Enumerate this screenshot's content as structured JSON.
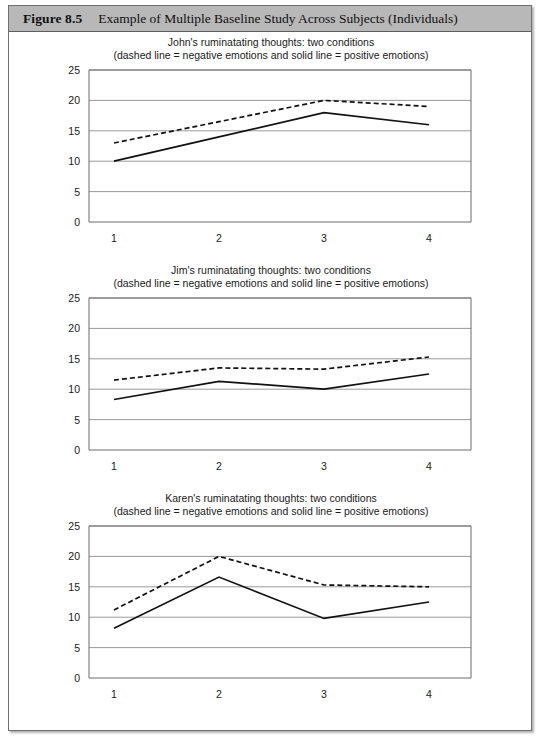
{
  "figure": {
    "number": "Figure 8.5",
    "caption": "Example of Multiple Baseline Study Across Subjects (Individuals)"
  },
  "axis": {
    "y_ticks": [
      "0",
      "5",
      "10",
      "15",
      "20",
      "25"
    ],
    "x_ticks": [
      "1",
      "2",
      "3",
      "4"
    ]
  },
  "charts": [
    {
      "title_line1": "John's ruminatating thoughts: two conditions",
      "title_line2": "(dashed line = negative emotions and solid line = positive emotions)"
    },
    {
      "title_line1": "Jim's ruminatating thoughts: two conditions",
      "title_line2": "(dashed line = negative emotions and solid line = positive emotions)"
    },
    {
      "title_line1": "Karen's ruminatating thoughts: two conditions",
      "title_line2": "(dashed line = negative emotions and solid line = positive emotions)"
    }
  ],
  "chart_data": [
    {
      "type": "line",
      "title": "John's ruminatating thoughts: two conditions",
      "subtitle": "(dashed line = negative emotions and solid line = positive emotions)",
      "xlabel": "",
      "ylabel": "",
      "x": [
        1,
        2,
        3,
        4
      ],
      "xlim": [
        1,
        4
      ],
      "ylim": [
        0,
        25
      ],
      "yticks": [
        0,
        5,
        10,
        15,
        20,
        25
      ],
      "grid": true,
      "legend": "none",
      "series": [
        {
          "name": "negative emotions (dashed)",
          "style": "dashed",
          "values": [
            13,
            16.5,
            20,
            19
          ]
        },
        {
          "name": "positive emotions (solid)",
          "style": "solid",
          "values": [
            10,
            14,
            18,
            16
          ]
        }
      ]
    },
    {
      "type": "line",
      "title": "Jim's ruminatating thoughts: two conditions",
      "subtitle": "(dashed line = negative emotions and solid line = positive emotions)",
      "xlabel": "",
      "ylabel": "",
      "x": [
        1,
        2,
        3,
        4
      ],
      "xlim": [
        1,
        4
      ],
      "ylim": [
        0,
        25
      ],
      "yticks": [
        0,
        5,
        10,
        15,
        20,
        25
      ],
      "grid": true,
      "legend": "none",
      "series": [
        {
          "name": "negative emotions (dashed)",
          "style": "dashed",
          "values": [
            11.5,
            13.5,
            13.3,
            15.3
          ]
        },
        {
          "name": "positive emotions (solid)",
          "style": "solid",
          "values": [
            8.3,
            11.3,
            10,
            12.5
          ]
        }
      ]
    },
    {
      "type": "line",
      "title": "Karen's ruminatating thoughts: two conditions",
      "subtitle": "(dashed line = negative emotions and solid line = positive emotions)",
      "xlabel": "",
      "ylabel": "",
      "x": [
        1,
        2,
        3,
        4
      ],
      "xlim": [
        1,
        4
      ],
      "ylim": [
        0,
        25
      ],
      "yticks": [
        0,
        5,
        10,
        15,
        20,
        25
      ],
      "grid": true,
      "legend": "none",
      "series": [
        {
          "name": "negative emotions (dashed)",
          "style": "dashed",
          "values": [
            11.2,
            20,
            15.3,
            15
          ]
        },
        {
          "name": "positive emotions (solid)",
          "style": "solid",
          "values": [
            8.2,
            16.6,
            9.8,
            12.5
          ]
        }
      ]
    }
  ]
}
